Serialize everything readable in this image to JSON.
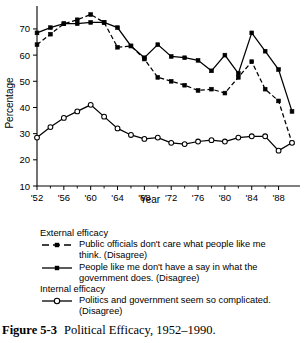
{
  "chart_data": {
    "type": "line",
    "title": "",
    "xlabel": "Year",
    "ylabel": "Percentage",
    "xlim": [
      1952,
      1990
    ],
    "ylim": [
      10,
      78
    ],
    "yticks": [
      10,
      20,
      30,
      40,
      50,
      60,
      70
    ],
    "xticks": [
      1952,
      1956,
      1960,
      1964,
      1968,
      1972,
      1976,
      1980,
      1984,
      1988
    ],
    "xtick_labels": [
      "'52",
      "'56",
      "'60",
      "'64",
      "'68",
      "'72",
      "'76",
      "'80",
      "'84",
      "'88"
    ],
    "grid": false,
    "legend_position": "below",
    "x": [
      1952,
      1954,
      1956,
      1958,
      1960,
      1962,
      1964,
      1966,
      1968,
      1970,
      1972,
      1974,
      1976,
      1978,
      1980,
      1982,
      1984,
      1986,
      1988,
      1990
    ],
    "series": [
      {
        "name": "Public officials don't care what people like me think. (Disagree)",
        "group": "External efficacy",
        "style": "dashed",
        "marker": "filled-square",
        "values": [
          64,
          68,
          72,
          73.5,
          75.5,
          72.5,
          63,
          63.5,
          58.5,
          51.5,
          50,
          48.5,
          46.5,
          47,
          45.5,
          51.5,
          57.5,
          47,
          42.5,
          26.5
        ]
      },
      {
        "name": "People like me don't have a say in what the government does. (Disagree)",
        "group": "External efficacy",
        "style": "solid",
        "marker": "filled-square",
        "values": [
          68.5,
          70.5,
          72,
          72,
          72.5,
          72.5,
          70.5,
          63.5,
          59,
          64,
          59.5,
          59,
          58,
          54,
          60,
          53,
          68.5,
          61.5,
          54.5,
          38.5
        ]
      },
      {
        "name": "Politics and government seem so complicated. (Disagree)",
        "group": "Internal efficacy",
        "style": "solid",
        "marker": "open-circle",
        "values": [
          28.5,
          32.5,
          36,
          38.5,
          41,
          36.5,
          32,
          29.5,
          28,
          28.5,
          26.5,
          26,
          27,
          27.5,
          27,
          28.5,
          29,
          29,
          23.5,
          26.5
        ]
      }
    ]
  },
  "legend": {
    "groups": [
      {
        "title": "External efficacy",
        "entries": [
          {
            "swatch": "dashed-filled-square",
            "line1": "Public officials don't care what people like me",
            "line2": "think. (Disagree)"
          },
          {
            "swatch": "solid-filled-square",
            "line1": "People like me don't have a say in what the",
            "line2": "government does. (Disagree)"
          }
        ]
      },
      {
        "title": "Internal efficacy",
        "entries": [
          {
            "swatch": "solid-open-circle",
            "line1": "Politics and government seem so complicated.",
            "line2": "(Disagree)"
          }
        ]
      }
    ]
  },
  "caption": {
    "label": "Figure 5-3",
    "text": "Political Efficacy, 1952–1990."
  }
}
